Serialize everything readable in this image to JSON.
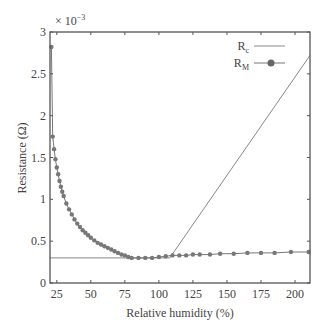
{
  "chart_data": {
    "type": "line",
    "title": "",
    "xlabel": "Relative humidity (%)",
    "ylabel": "Resistance (Ω)",
    "y_multiplier": "× 10",
    "y_multiplier_exp": "−3",
    "xlim": [
      20,
      211
    ],
    "ylim": [
      0,
      3
    ],
    "x_ticks": [
      25,
      50,
      75,
      100,
      125,
      150,
      175,
      200
    ],
    "y_ticks": [
      0,
      0.5,
      1,
      1.5,
      2,
      2.5,
      3
    ],
    "y_tick_labels": [
      "0",
      "0.5",
      "1",
      "1.5",
      "2",
      "2.5",
      "3"
    ],
    "grid": false,
    "legend_position": "upper right",
    "series": [
      {
        "name": "Rc",
        "label_main": "R",
        "label_sub": "c",
        "marker": "none",
        "color": "#888888",
        "x": [
          20,
          108,
          211
        ],
        "y": [
          0.3,
          0.3,
          2.72
        ]
      },
      {
        "name": "RM",
        "label_main": "R",
        "label_sub": "M",
        "marker": "circle",
        "color": "#777777",
        "x": [
          21,
          22,
          23,
          24,
          25,
          26,
          27,
          28,
          29,
          30,
          32,
          34,
          36,
          38,
          40,
          42,
          44,
          46,
          48,
          50,
          52.5,
          55,
          57.5,
          60,
          62.5,
          65,
          67.5,
          70,
          72.5,
          75,
          77.5,
          80,
          85,
          90,
          95,
          100,
          105,
          110,
          115,
          120,
          125,
          130,
          137.5,
          145,
          155,
          165,
          175,
          185,
          197,
          210
        ],
        "y": [
          2.82,
          1.75,
          1.6,
          1.48,
          1.38,
          1.3,
          1.22,
          1.15,
          1.09,
          1.04,
          0.95,
          0.88,
          0.82,
          0.76,
          0.71,
          0.67,
          0.63,
          0.6,
          0.57,
          0.54,
          0.51,
          0.48,
          0.46,
          0.44,
          0.42,
          0.4,
          0.38,
          0.36,
          0.34,
          0.33,
          0.31,
          0.3,
          0.3,
          0.3,
          0.3,
          0.31,
          0.32,
          0.33,
          0.33,
          0.33,
          0.34,
          0.34,
          0.34,
          0.35,
          0.35,
          0.36,
          0.36,
          0.36,
          0.37,
          0.37
        ]
      }
    ]
  }
}
